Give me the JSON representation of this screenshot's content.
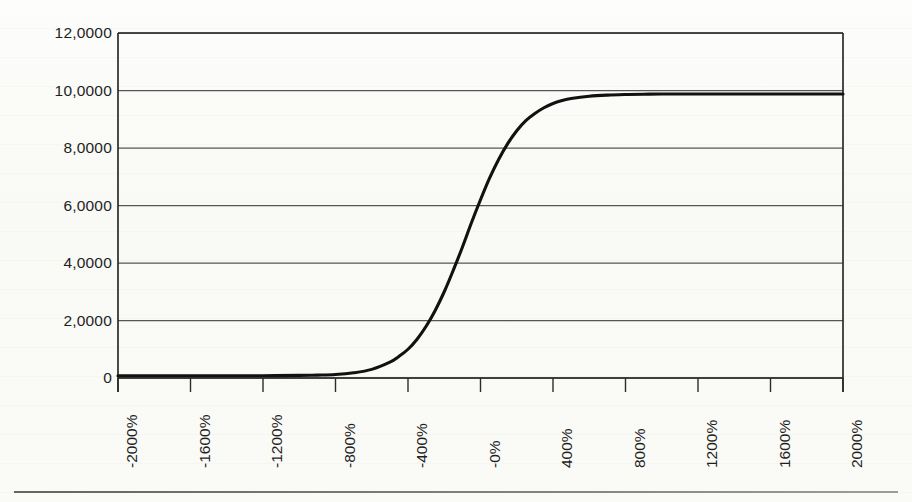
{
  "figure": {
    "background_color": "#fbfbf9",
    "axis_color": "#2b2b2b",
    "grid_color": "#555555",
    "curve_color": "#111111"
  },
  "chart_data": {
    "type": "line",
    "title": "",
    "subtitle": "",
    "xlabel": "",
    "ylabel": "",
    "grid": true,
    "legend": false,
    "legend_position": "none",
    "decimal_separator": ",",
    "xlim": [
      -2000,
      2000
    ],
    "ylim": [
      0,
      12.0
    ],
    "xtick_labels": [
      "-2000%",
      "-1600%",
      "-1200%",
      "-800%",
      "-400%",
      "-0%",
      "400%",
      "800%",
      "1200%",
      "1600%",
      "2000%"
    ],
    "xtick_values": [
      -2000,
      -1600,
      -1200,
      -800,
      -400,
      0,
      400,
      800,
      1200,
      1600,
      2000
    ],
    "ytick_labels": [
      "0",
      "2,0000",
      "4,0000",
      "6,0000",
      "8,0000",
      "10,0000",
      "12,0000"
    ],
    "ytick_values": [
      0,
      2.0,
      4.0,
      6.0,
      8.0,
      10.0,
      12.0
    ],
    "series": [
      {
        "name": "sigmoid",
        "x": [
          -2000,
          -1800,
          -1600,
          -1400,
          -1200,
          -1000,
          -900,
          -800,
          -700,
          -600,
          -500,
          -450,
          -400,
          -350,
          -300,
          -250,
          -200,
          -150,
          -100,
          -50,
          0,
          50,
          100,
          150,
          200,
          250,
          300,
          350,
          400,
          450,
          500,
          600,
          700,
          800,
          900,
          1000,
          1200,
          1400,
          1600,
          1800,
          2000
        ],
        "y": [
          0.08,
          0.08,
          0.08,
          0.08,
          0.08,
          0.09,
          0.1,
          0.12,
          0.18,
          0.3,
          0.55,
          0.75,
          1.0,
          1.35,
          1.8,
          2.35,
          3.0,
          3.75,
          4.55,
          5.4,
          6.2,
          6.95,
          7.6,
          8.15,
          8.6,
          8.95,
          9.2,
          9.4,
          9.55,
          9.65,
          9.72,
          9.8,
          9.84,
          9.86,
          9.87,
          9.88,
          9.88,
          9.88,
          9.88,
          9.88,
          9.88
        ]
      }
    ],
    "plateau_value": 9.88,
    "baseline_value": 0.08
  }
}
